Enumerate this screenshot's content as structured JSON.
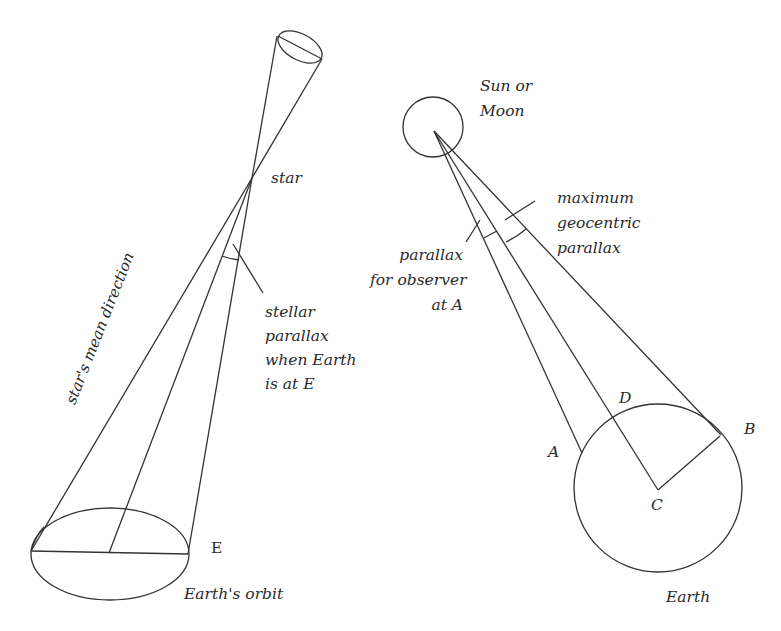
{
  "figure": {
    "left_panel": {
      "name": "stellar-parallax",
      "labels": {
        "star": "star",
        "stellar_parallax": "stellar\nparallax\nwhen Earth\nis at E",
        "mean_direction": "star's mean direction",
        "point_e": "E",
        "orbit": "Earth's orbit"
      }
    },
    "right_panel": {
      "name": "geocentric-parallax",
      "labels": {
        "sun_or_moon": "Sun or\nMoon",
        "max_geocentric": "maximum\ngeocentric\nparallax",
        "observer_parallax": "parallax\nfor observer\nat A",
        "point_a": "A",
        "point_b": "B",
        "point_c": "C",
        "point_d": "D",
        "earth": "Earth"
      }
    },
    "colors": {
      "line": "#333333",
      "text": "#2a2a2a",
      "background": "#ffffff"
    }
  }
}
